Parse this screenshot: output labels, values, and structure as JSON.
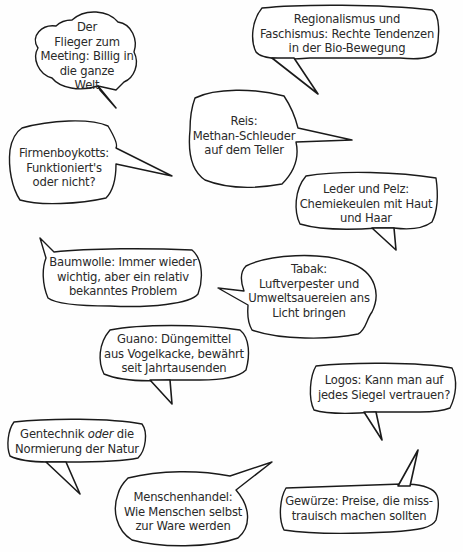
{
  "bubbles": [
    {
      "id": "flieger",
      "lines": [
        "Der",
        "Flieger zum",
        "Meeting: Billig in",
        "die ganze",
        "Welt"
      ]
    },
    {
      "id": "regionalismus",
      "lines": [
        "Regionalismus und",
        "Faschismus: Rechte Tendenzen",
        "in der Bio-Bewegung"
      ]
    },
    {
      "id": "reis",
      "lines": [
        "Reis:",
        "Methan-Schleuder",
        "auf dem Teller"
      ]
    },
    {
      "id": "firmenboykotts",
      "lines": [
        "Firmenboykotts:",
        "Funktioniert's",
        "oder nicht?"
      ]
    },
    {
      "id": "leder",
      "lines": [
        "Leder und Pelz:",
        "Chemiekeulen mit Haut",
        "und Haar"
      ]
    },
    {
      "id": "baumwolle",
      "lines": [
        "Baumwolle: Immer wieder",
        "wichtig, aber ein relativ",
        "bekanntes Problem"
      ]
    },
    {
      "id": "tabak",
      "lines": [
        "Tabak:",
        "Luftverpester und",
        "Umweltsauereien ans",
        "Licht bringen"
      ]
    },
    {
      "id": "guano",
      "lines": [
        "Guano: Düngemittel",
        "aus Vogelkacke, bewährt",
        "seit Jahrtausenden"
      ]
    },
    {
      "id": "logos",
      "lines": [
        "Logos: Kann man auf",
        "jedes Siegel vertrauen?"
      ]
    },
    {
      "id": "gentechnik",
      "lines_prefix": "Gentechnik ",
      "lines_italic": "oder",
      "lines_suffix": " die",
      "line2": "Normierung der Natur"
    },
    {
      "id": "menschenhandel",
      "lines": [
        "Menschenhandel:",
        "Wie Menschen selbst",
        "zur Ware werden"
      ]
    },
    {
      "id": "gewuerze",
      "lines": [
        "Gewürze: Preise, die miss-",
        "trauisch machen sollten"
      ]
    }
  ],
  "colors": {
    "stroke": "#1a1a1a",
    "text": "#2a2a2a",
    "background": "#fefefe"
  }
}
